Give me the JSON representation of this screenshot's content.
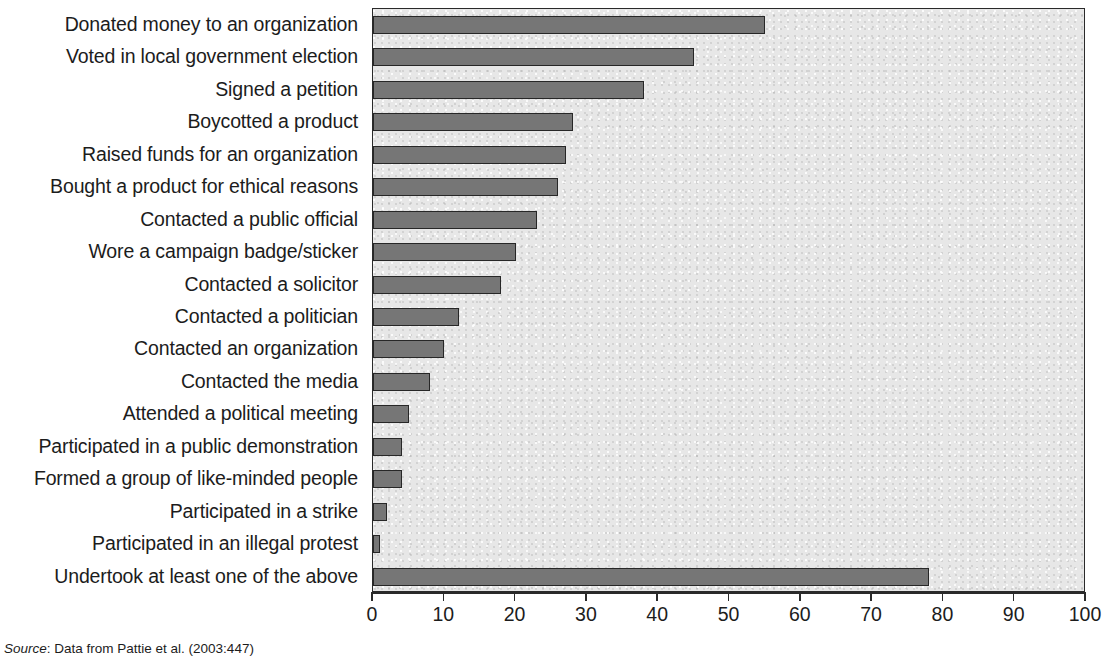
{
  "chart_data": {
    "type": "bar",
    "orientation": "horizontal",
    "title": "",
    "xlabel": "",
    "ylabel": "",
    "xlim": [
      0,
      100
    ],
    "xticks": [
      0,
      10,
      20,
      30,
      40,
      50,
      60,
      70,
      80,
      90,
      100
    ],
    "grid": false,
    "legend": null,
    "bar_color": "#767676",
    "bar_edge_color": "#272727",
    "plot_background": "#e7e7e7",
    "categories": [
      "Donated money to an organization",
      "Voted in local government election",
      "Signed a petition",
      "Boycotted a product",
      "Raised funds for an organization",
      "Bought a product for ethical reasons",
      "Contacted a public official",
      "Wore a campaign badge/sticker",
      "Contacted a solicitor",
      "Contacted a politician",
      "Contacted an organization",
      "Contacted the media",
      "Attended a political meeting",
      "Participated in a public demonstration",
      "Formed a group of like-minded people",
      "Participated in a strike",
      "Participated in an illegal protest",
      "Undertook at least one of the above"
    ],
    "values": [
      55,
      45,
      38,
      28,
      27,
      26,
      23,
      20,
      18,
      12,
      10,
      8,
      5,
      4,
      4,
      2,
      1,
      78
    ]
  },
  "source": {
    "prefix": "Source",
    "text": ": Data from Pattie et al. (2003:447)"
  }
}
